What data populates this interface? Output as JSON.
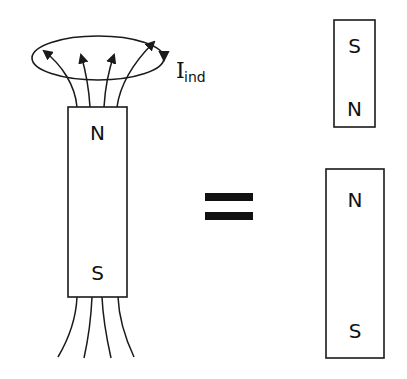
{
  "diagram": {
    "colors": {
      "stroke": "#1a1a1a",
      "background": "#ffffff"
    },
    "left_magnet": {
      "top_pole": "N",
      "bottom_pole": "S"
    },
    "loop": {
      "current_label_main": "I",
      "current_label_sub": "ind"
    },
    "equals": "=",
    "right_top_magnet": {
      "top_pole": "S",
      "bottom_pole": "N"
    },
    "right_bottom_magnet": {
      "top_pole": "N",
      "bottom_pole": "S"
    }
  }
}
